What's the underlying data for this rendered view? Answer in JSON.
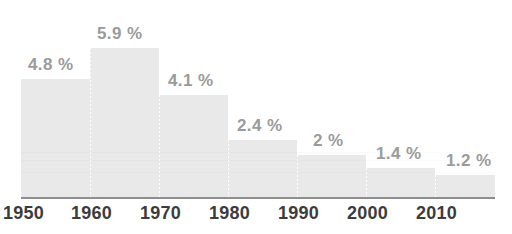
{
  "chart_data": {
    "type": "bar",
    "title": "",
    "subtitle": "",
    "xlabel": "",
    "ylabel": "",
    "categories": [
      "1950",
      "1960",
      "1970",
      "1980",
      "1990",
      "2000",
      "2010"
    ],
    "values": [
      4.8,
      5.9,
      4.1,
      2.4,
      2.0,
      1.4,
      1.2
    ],
    "value_labels": [
      "4.8 %",
      "5.9 %",
      "4.1 %",
      "2.4 %",
      "2 %",
      "1.4 %",
      "1.2 %"
    ],
    "ylim": [
      0,
      5.9
    ],
    "grid": false,
    "legend": null,
    "legend_position": "none",
    "annotations": [],
    "units": "%",
    "bar_color": "#e9e9e9",
    "value_label_color": "#9b9b9b",
    "tick_label_color": "#3c3c3c",
    "axis_line_color": "#8e8e8e",
    "background_color": "#ffffff"
  },
  "axis": {
    "ticks": [
      {
        "label": "1950",
        "x": 3
      },
      {
        "label": "1960",
        "x": 71
      },
      {
        "label": "1970",
        "x": 140
      },
      {
        "label": "1980",
        "x": 209
      },
      {
        "label": "1990",
        "x": 278
      },
      {
        "label": "2000",
        "x": 347
      },
      {
        "label": "2010",
        "x": 416
      }
    ]
  },
  "bars": [
    {
      "name": "bar-1950",
      "label": "4.8 %",
      "value": 4.8,
      "x": 21,
      "width": 69,
      "top": 79,
      "label_x": 28,
      "label_y": 56
    },
    {
      "name": "bar-1960",
      "label": "5.9 %",
      "value": 5.9,
      "x": 90,
      "width": 69,
      "top": 48,
      "label_x": 97,
      "label_y": 25
    },
    {
      "name": "bar-1970",
      "label": "4.1 %",
      "value": 4.1,
      "x": 159,
      "width": 69,
      "top": 95,
      "label_x": 168,
      "label_y": 72
    },
    {
      "name": "bar-1980",
      "label": "2.4 %",
      "value": 2.4,
      "x": 228,
      "width": 69,
      "top": 140,
      "label_x": 237,
      "label_y": 117
    },
    {
      "name": "bar-1990",
      "label": "2 %",
      "value": 2.0,
      "x": 297,
      "width": 69,
      "top": 155,
      "label_x": 313,
      "label_y": 132
    },
    {
      "name": "bar-2000",
      "label": "1.4 %",
      "value": 1.4,
      "x": 366,
      "width": 69,
      "top": 168,
      "label_x": 376,
      "label_y": 145
    },
    {
      "name": "bar-2010",
      "label": "1.2 %",
      "value": 1.2,
      "x": 435,
      "width": 60,
      "top": 175,
      "label_x": 446,
      "label_y": 152
    }
  ]
}
